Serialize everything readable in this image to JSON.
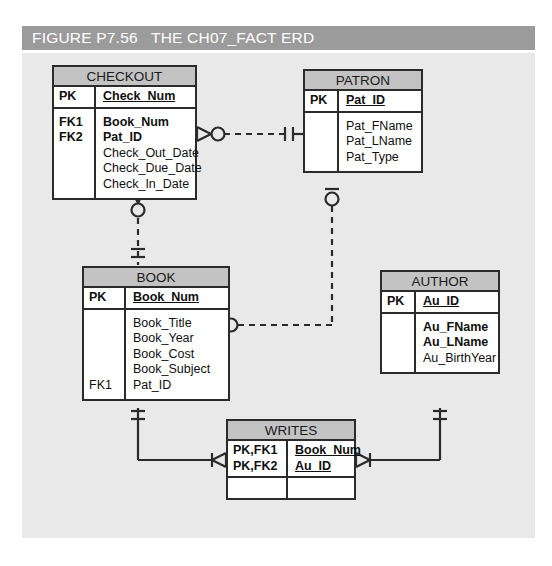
{
  "figure": {
    "label": "FIGURE P7.56",
    "title": "THE CH07_FACT ERD",
    "full_title": "FIGURE P7.56   THE CH07_FACT ERD",
    "banner_color": "#9b9b9b",
    "banner_text_color": "#ffffff",
    "canvas_color": "#e9e9e9",
    "entity_header_color": "#c3c3c3",
    "line_color": "#2b2b2b"
  },
  "entities": {
    "checkout": {
      "name": "CHECKOUT",
      "sections": [
        {
          "rows": [
            {
              "key": "PK",
              "attr": "Check_Num",
              "bold": true,
              "underline": true
            }
          ]
        },
        {
          "rows": [
            {
              "key": "FK1",
              "attr": "Book_Num",
              "bold": true,
              "underline": false
            },
            {
              "key": "FK2",
              "attr": "Pat_ID",
              "bold": true,
              "underline": false
            },
            {
              "key": "",
              "attr": "Check_Out_Date",
              "bold": false,
              "underline": false
            },
            {
              "key": "",
              "attr": "Check_Due_Date",
              "bold": false,
              "underline": false
            },
            {
              "key": "",
              "attr": "Check_In_Date",
              "bold": false,
              "underline": false
            }
          ]
        }
      ]
    },
    "patron": {
      "name": "PATRON",
      "sections": [
        {
          "rows": [
            {
              "key": "PK",
              "attr": "Pat_ID",
              "bold": true,
              "underline": true
            }
          ]
        },
        {
          "rows": [
            {
              "key": "",
              "attr": "Pat_FName",
              "bold": false,
              "underline": false
            },
            {
              "key": "",
              "attr": "Pat_LName",
              "bold": false,
              "underline": false
            },
            {
              "key": "",
              "attr": "Pat_Type",
              "bold": false,
              "underline": false
            }
          ]
        }
      ]
    },
    "book": {
      "name": "BOOK",
      "sections": [
        {
          "rows": [
            {
              "key": "PK",
              "attr": "Book_Num",
              "bold": true,
              "underline": true
            }
          ]
        },
        {
          "rows": [
            {
              "key": "",
              "attr": "Book_Title",
              "bold": false,
              "underline": false
            },
            {
              "key": "",
              "attr": "Book_Year",
              "bold": false,
              "underline": false
            },
            {
              "key": "",
              "attr": "Book_Cost",
              "bold": false,
              "underline": false
            },
            {
              "key": "",
              "attr": "Book_Subject",
              "bold": false,
              "underline": false
            },
            {
              "key": "FK1",
              "attr": "Pat_ID",
              "bold": false,
              "underline": false
            }
          ]
        }
      ]
    },
    "author": {
      "name": "AUTHOR",
      "sections": [
        {
          "rows": [
            {
              "key": "PK",
              "attr": "Au_ID",
              "bold": true,
              "underline": true
            }
          ]
        },
        {
          "rows": [
            {
              "key": "",
              "attr": "Au_FName",
              "bold": true,
              "underline": false
            },
            {
              "key": "",
              "attr": "Au_LName",
              "bold": true,
              "underline": false
            },
            {
              "key": "",
              "attr": "Au_BirthYear",
              "bold": false,
              "underline": false
            }
          ]
        }
      ]
    },
    "writes": {
      "name": "WRITES",
      "sections": [
        {
          "rows": [
            {
              "key": "PK,FK1",
              "attr": "Book_Num",
              "bold": true,
              "underline": true
            },
            {
              "key": "PK,FK2",
              "attr": "Au_ID",
              "bold": true,
              "underline": true
            }
          ]
        },
        {
          "rows": [
            {
              "key": "",
              "attr": "",
              "bold": false,
              "underline": false
            }
          ]
        }
      ]
    }
  },
  "relationships": [
    {
      "name": "checkout-patron",
      "from": "CHECKOUT",
      "to": "PATRON",
      "line_style": "dashed",
      "from_cardinality": "zero-or-many",
      "to_cardinality": "one-and-only-one"
    },
    {
      "name": "checkout-book",
      "from": "CHECKOUT",
      "to": "BOOK",
      "line_style": "dashed",
      "from_cardinality": "zero-or-many",
      "to_cardinality": "one-and-only-one"
    },
    {
      "name": "patron-book",
      "from": "PATRON",
      "to": "BOOK",
      "line_style": "dashed",
      "from_cardinality": "zero-or-one",
      "to_cardinality": "zero-or-many"
    },
    {
      "name": "book-writes",
      "from": "BOOK",
      "to": "WRITES",
      "line_style": "solid",
      "from_cardinality": "one-and-only-one",
      "to_cardinality": "one-or-many"
    },
    {
      "name": "author-writes",
      "from": "AUTHOR",
      "to": "WRITES",
      "line_style": "solid",
      "from_cardinality": "one-and-only-one",
      "to_cardinality": "one-or-many"
    }
  ]
}
